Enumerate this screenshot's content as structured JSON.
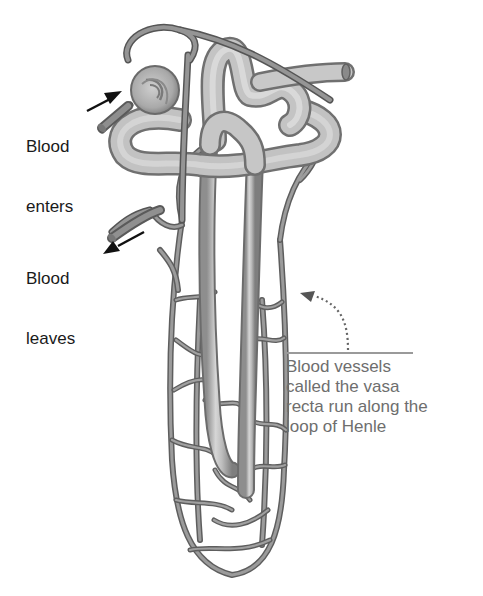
{
  "figure": {
    "colors": {
      "tubule_fill": "#b4b4b4",
      "tubule_highlight": "#e0e0e0",
      "vessel_stroke": "#6a6a6a",
      "vessel_fill": "#8c8c8c",
      "label_text": "#1a1a1a",
      "caption_text": "#6e6e6e",
      "caption_rule": "#9a9a9a"
    }
  },
  "labels": {
    "blood_enters": {
      "line1": "Blood",
      "line2": "enters"
    },
    "blood_leaves": {
      "line1": "Blood",
      "line2": "leaves"
    },
    "vasa_recta_caption": {
      "line1": "Blood vessels",
      "line2": "called the vasa",
      "line3": "recta run along the",
      "line4": "loop of Henle"
    }
  },
  "arrows": {
    "blood_enters_arrow": "solid-arrow-icon",
    "blood_leaves_arrow": "solid-arrow-icon",
    "caption_pointer": "dotted-curved-arrow-icon"
  }
}
